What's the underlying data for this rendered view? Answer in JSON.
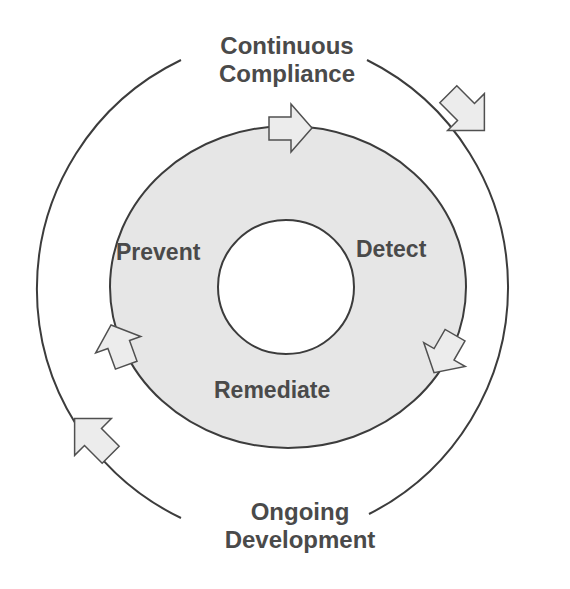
{
  "diagram": {
    "type": "cycle",
    "outer_cycle": {
      "top_label": {
        "line1": "Continuous",
        "line2": "Compliance"
      },
      "bottom_label": {
        "line1": "Ongoing",
        "line2": "Development"
      },
      "direction": "clockwise"
    },
    "inner_cycle": {
      "stages": [
        {
          "label": "Prevent"
        },
        {
          "label": "Detect"
        },
        {
          "label": "Remediate"
        }
      ],
      "direction": "clockwise"
    },
    "colors": {
      "ring_fill": "#e6e6e6",
      "stroke": "#3c3c3c",
      "arrow_fill": "#ececec",
      "text": "#4a4a4a",
      "background": "#ffffff"
    }
  }
}
